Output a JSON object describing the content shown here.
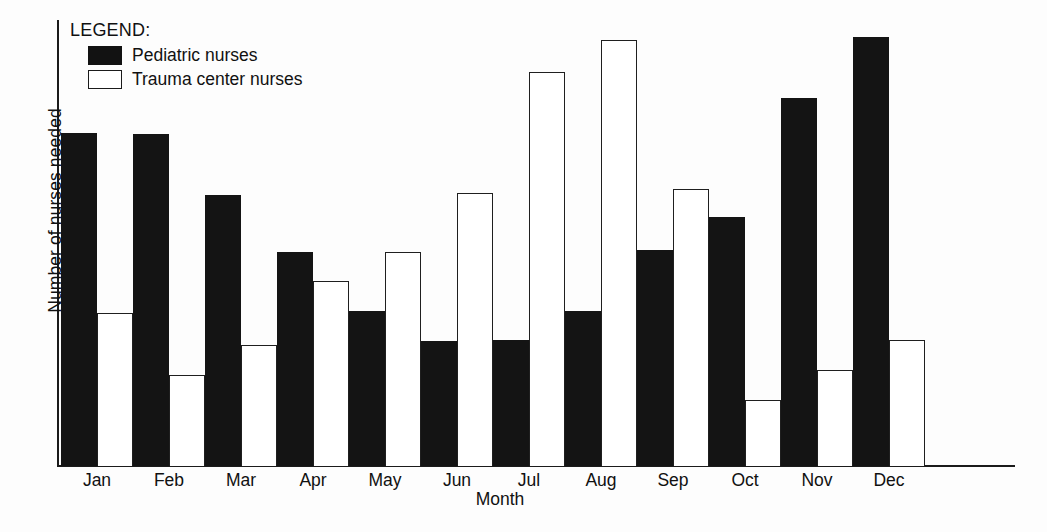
{
  "chart_data": {
    "type": "bar",
    "title": "",
    "xlabel": "Month",
    "ylabel": "Number of nurses needed",
    "grid": false,
    "legend_position": "top-left",
    "legend_title": "LEGEND:",
    "ylim": [
      0,
      446
    ],
    "y_ticks_shown": false,
    "categories": [
      "Jan",
      "Feb",
      "Mar",
      "Apr",
      "May",
      "Jun",
      "Jul",
      "Aug",
      "Sep",
      "Oct",
      "Nov",
      "Dec"
    ],
    "series": [
      {
        "name": "Pediatric nurses",
        "style": "filled",
        "color": "#141414",
        "values": [
          333,
          332,
          271,
          214,
          155,
          125,
          126,
          155,
          216,
          249,
          368,
          429
        ]
      },
      {
        "name": "Trauma center nurses",
        "style": "hollow",
        "color": "#ffffff",
        "edge_color": "#1f1f1f",
        "values": [
          153,
          91,
          121,
          185,
          214,
          273,
          394,
          426,
          277,
          66,
          96,
          126
        ]
      }
    ]
  },
  "legend": {
    "title": "LEGEND:",
    "entries": [
      {
        "label": "Pediatric nurses",
        "swatch": "filled-black-square"
      },
      {
        "label": "Trauma center nurses",
        "swatch": "hollow-white-square"
      }
    ]
  },
  "axes": {
    "y_title": "Number of nurses needed",
    "x_title": "Month"
  }
}
